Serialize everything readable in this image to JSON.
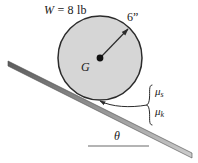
{
  "figure": {
    "colors": {
      "disk_fill": "#d6d6d6",
      "stroke": "#2b2b2b",
      "incline_fill": "#8c8c8c",
      "text": "#1a1a1a",
      "background": "#ffffff"
    },
    "labels": {
      "weight": "W = 8 lb",
      "weight_symbol": "W",
      "weight_equals": " = 8 lb",
      "radius": "6”",
      "center": "G",
      "mu_static": "μ",
      "mu_static_sub": "s",
      "mu_kinetic": "μ",
      "mu_kinetic_sub": "k",
      "angle": "θ"
    },
    "geometry": {
      "disk_center_x": 100,
      "disk_center_y": 58,
      "disk_radius": 42,
      "radius_arrow_tip_x": 129,
      "radius_arrow_tip_y": 28,
      "incline_start_x": 8,
      "incline_start_y": 61,
      "incline_end_x": 192,
      "incline_end_y": 153,
      "contact_point_x": 98,
      "contact_point_y": 100,
      "reference_line_x1": 88,
      "reference_line_x2": 149,
      "reference_line_y": 146,
      "brace_x": 149,
      "brace_top_y": 85,
      "brace_bottom_y": 125
    }
  }
}
